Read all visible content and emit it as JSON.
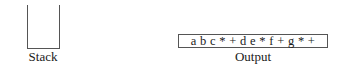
{
  "stack": {
    "label": "Stack",
    "items": []
  },
  "output": {
    "label": "Output",
    "value": "a b c * + d e * f + g * +"
  }
}
